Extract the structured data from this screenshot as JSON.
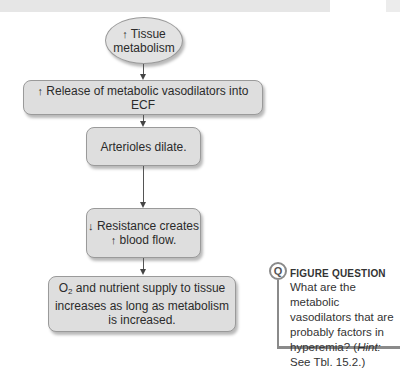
{
  "flowchart": {
    "nodes": [
      {
        "id": "tissue-metabolism",
        "shape": "ellipse",
        "prefix_arrow": "↑",
        "line1": "Tissue",
        "line2": "metabolism"
      },
      {
        "id": "release-vasodilators",
        "shape": "rounded-rect",
        "prefix_arrow": "↑",
        "text": "Release of metabolic vasodilators into ECF"
      },
      {
        "id": "arterioles-dilate",
        "shape": "rounded-rect",
        "text": "Arterioles dilate."
      },
      {
        "id": "resistance-blood-flow",
        "shape": "rounded-rect",
        "prefix_arrow1": "↓",
        "line1": "Resistance creates",
        "prefix_arrow2": "↑",
        "line2": "blood flow."
      },
      {
        "id": "o2-supply",
        "shape": "rounded-rect",
        "o2_main": "O",
        "o2_sub": "2",
        "line1_rest": " and nutrient supply to tissue",
        "line2": "increases as long as metabolism",
        "line3": "is increased."
      }
    ],
    "edges": [
      {
        "from": "tissue-metabolism",
        "to": "release-vasodilators"
      },
      {
        "from": "release-vasodilators",
        "to": "arterioles-dilate"
      },
      {
        "from": "arterioles-dilate",
        "to": "resistance-blood-flow"
      },
      {
        "from": "resistance-blood-flow",
        "to": "o2-supply"
      }
    ]
  },
  "figure_question": {
    "icon_letter": "Q",
    "title": "FIGURE QUESTION",
    "text_before_hint": "What are the metabolic vasodilators that are probably factors in hyperemia? (",
    "hint_label": "Hint:",
    "text_after_hint": " See Tbl. 15.2.)"
  },
  "colors": {
    "node_fill": "#dedede",
    "node_border": "#9a9a9a",
    "arrow": "#444444",
    "question_accent": "#8a8a8a"
  }
}
